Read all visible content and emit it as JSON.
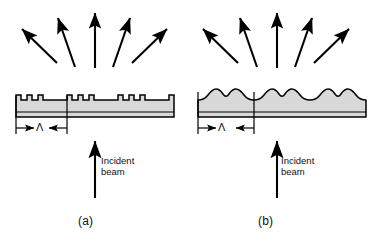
{
  "figure": {
    "background_color": "#ffffff",
    "line_color": "#000000",
    "grating_fill_color": "#d8d8d8",
    "panels": [
      {
        "id": "a",
        "caption": "(a)",
        "grating_type": "binary rectangular (square-wave) surface-relief grating",
        "period_label": "Λ",
        "periods_shown": 3,
        "teeth_per_period": 3,
        "incident_beam_label_line1": "Incident",
        "incident_beam_label_line2": "beam",
        "diffracted_orders": 5
      },
      {
        "id": "b",
        "caption": "(b)",
        "grating_type": "smooth sinusoidal double-peaked surface-relief grating",
        "period_label": "Λ",
        "periods_shown": 3,
        "teeth_per_period": 2,
        "incident_beam_label_line1": "Incident",
        "incident_beam_label_line2": "beam",
        "diffracted_orders": 5
      }
    ]
  }
}
